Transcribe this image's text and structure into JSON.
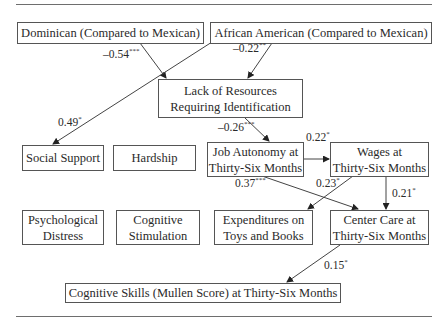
{
  "nodes": {
    "dominican": "Dominican (Compared to Mexican)",
    "african_american": "African American (Compared to Mexican)",
    "lack_resources": "Lack of Resources\nRequiring Identification",
    "social_support": "Social Support",
    "hardship": "Hardship",
    "job_autonomy": "Job Autonomy at\nThirty-Six Months",
    "wages": "Wages at\nThirty-Six Months",
    "psych_distress": "Psychological\nDistress",
    "cog_stimulation": "Cognitive\nStimulation",
    "expenditures": "Expenditures on\nToys and Books",
    "center_care": "Center Care at\nThirty-Six Months",
    "cog_skills": "Cognitive Skills (Mullen Score) at Thirty-Six Months"
  },
  "paths": {
    "dom_to_lack": {
      "coef": "–0.54",
      "sig": "***"
    },
    "aa_to_lack": {
      "coef": "–0.22",
      "sig": "**"
    },
    "aa_to_social": {
      "coef": "0.49",
      "sig": "*"
    },
    "lack_to_job": {
      "coef": "–0.26",
      "sig": "***"
    },
    "job_to_wages": {
      "coef": "0.22",
      "sig": "*"
    },
    "job_to_center": {
      "coef": "0.37",
      "sig": "***"
    },
    "wages_to_expend": {
      "coef": "0.23",
      "sig": "*"
    },
    "wages_to_center": {
      "coef": "0.21",
      "sig": "*"
    },
    "center_to_cog": {
      "coef": "0.15",
      "sig": "*"
    }
  }
}
